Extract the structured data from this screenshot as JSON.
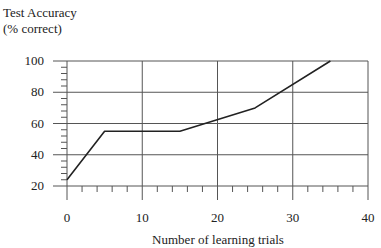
{
  "chart_data": {
    "type": "line",
    "title": "",
    "ylabel_line1": "Test Accuracy",
    "ylabel_line2": "(% correct)",
    "xlabel": "Number of learning trials",
    "x": [
      0,
      5,
      15,
      25,
      35
    ],
    "series": [
      {
        "name": "Test Accuracy",
        "values": [
          24,
          55,
          55,
          70,
          100
        ]
      }
    ],
    "xlim": [
      0,
      40
    ],
    "ylim": [
      20,
      100
    ],
    "xticks": [
      0,
      10,
      20,
      30,
      40
    ],
    "yticks": [
      20,
      40,
      60,
      80,
      100
    ],
    "x_tick_labels": [
      "0",
      "10",
      "20",
      "30",
      "40"
    ],
    "y_tick_labels": [
      "20",
      "40",
      "60",
      "80",
      "100"
    ],
    "x_minor_step": 2,
    "y_minor_step": 4,
    "grid": true,
    "legend": null,
    "line_color": "#222222",
    "grid_color": "#555555"
  }
}
